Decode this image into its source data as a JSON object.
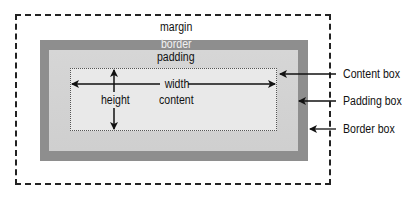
{
  "diagram": {
    "labels": {
      "margin": "margin",
      "border": "border",
      "padding": "padding",
      "width": "width",
      "height": "height",
      "content": "content"
    },
    "callouts": [
      {
        "label": "Content box",
        "points_to": "content"
      },
      {
        "label": "Padding box",
        "points_to": "padding"
      },
      {
        "label": "Border box",
        "points_to": "border"
      }
    ],
    "colors": {
      "border_fill": "#8e8e8e",
      "padding_fill": "#d3d3d3",
      "content_fill": "#e9e9e9",
      "lines": "#111111"
    }
  }
}
